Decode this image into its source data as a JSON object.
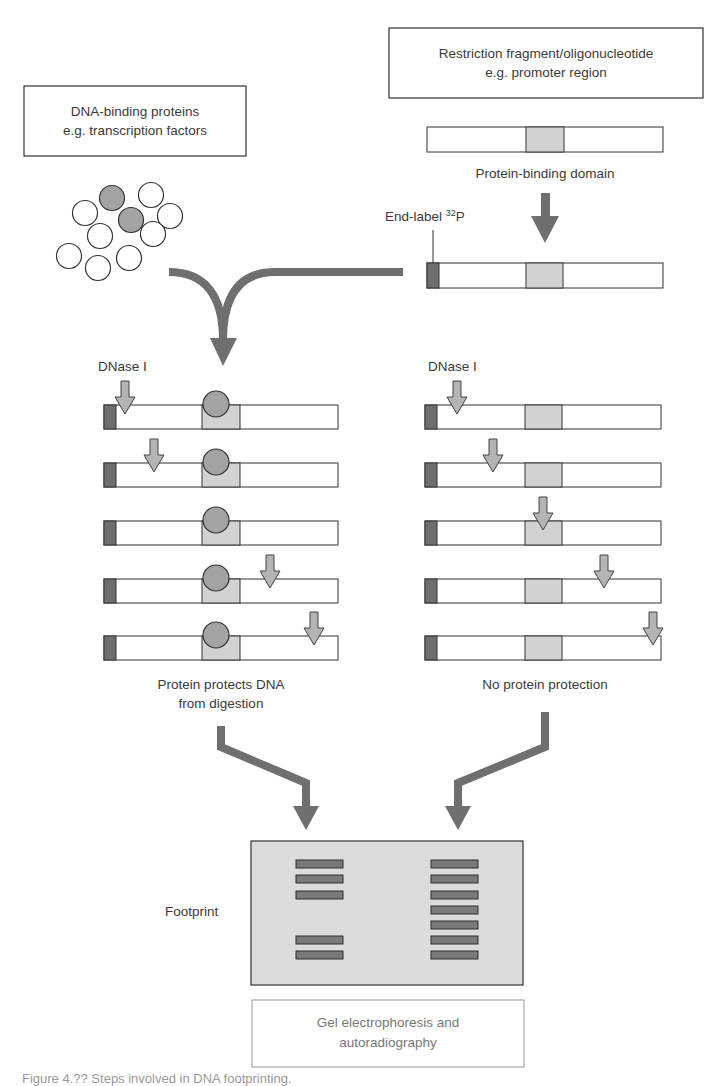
{
  "boxes": {
    "proteins": {
      "line1": "DNA-binding proteins",
      "line2": "e.g. transcription factors"
    },
    "fragment": {
      "line1": "Restriction fragment/oligonucleotide",
      "line2": "e.g. promoter region"
    },
    "gel_method": {
      "line1": "Gel electrophoresis and",
      "line2": "autoradiography"
    }
  },
  "labels": {
    "binding_domain": "Protein-binding domain",
    "end_label": "End-label ",
    "end_label_sup": "32",
    "end_label_suffix": "P",
    "dnase_left": "DNase I",
    "dnase_right": "DNase I",
    "protected_line1": "Protein protects DNA",
    "protected_line2": "from digestion",
    "unprotected": "No protein protection",
    "footprint": "Footprint"
  },
  "caption": "Figure 4.?? Steps involved in DNA footprinting.",
  "colors": {
    "arrow": "#6f6f6f",
    "small_arrow": "#b4b4b4",
    "end_label_cap": "#6e6e6e",
    "binding_domain": "#d2d2d2",
    "protein_bound": "#a3a3a3",
    "gel_bg": "#dcdcdc",
    "gel_band": "#7a7a7a",
    "outline": "#333333"
  },
  "proteins": [
    {
      "cx": 112,
      "cy": 198,
      "filled": true
    },
    {
      "cx": 131,
      "cy": 220,
      "filled": true
    },
    {
      "cx": 85,
      "cy": 213,
      "filled": false
    },
    {
      "cx": 151,
      "cy": 195,
      "filled": false
    },
    {
      "cx": 170,
      "cy": 216,
      "filled": false
    },
    {
      "cx": 100,
      "cy": 236,
      "filled": false
    },
    {
      "cx": 153,
      "cy": 234,
      "filled": false
    },
    {
      "cx": 69,
      "cy": 256,
      "filled": false
    },
    {
      "cx": 129,
      "cy": 258,
      "filled": false
    },
    {
      "cx": 98,
      "cy": 268,
      "filled": false
    }
  ],
  "lanes": {
    "protected_cut_positions_x": [
      125,
      154,
      null,
      270,
      314
    ],
    "unprotected_cut_positions_x": [
      457,
      493,
      543,
      604,
      653
    ]
  },
  "gel": {
    "footprint_lane_bands": [
      1,
      2,
      3,
      6,
      7
    ],
    "control_lane_bands": [
      1,
      2,
      3,
      4,
      5,
      6,
      7
    ]
  }
}
